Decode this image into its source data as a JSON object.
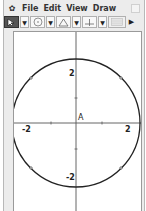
{
  "menubar": {
    "items": [
      "File",
      "Edit",
      "View",
      "Draw"
    ]
  },
  "toolbar": {
    "tools": [
      {
        "name": "pointer-tool",
        "icon": "pointer-icon",
        "selected": true
      },
      {
        "name": "circle-tool",
        "icon": "circle-icon",
        "selected": false
      },
      {
        "name": "polygon-tool",
        "icon": "triangle-icon",
        "selected": false
      },
      {
        "name": "axes-tool",
        "icon": "axes-icon",
        "selected": false
      },
      {
        "name": "table-tool",
        "icon": "table-icon",
        "selected": false
      }
    ],
    "overflow_icon": "right-arrow-icon"
  },
  "canvas": {
    "axes": {
      "x_labels": [
        "-2",
        "2"
      ],
      "y_labels": [
        "2",
        "-2"
      ],
      "origin_label": "A"
    },
    "circle": {
      "center": "A",
      "radius": 2
    },
    "colors": {
      "axis": "#555555",
      "circle": "#222222"
    }
  }
}
